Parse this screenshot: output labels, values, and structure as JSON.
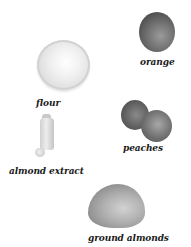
{
  "ingredients": [
    {
      "name": "orange",
      "label": "orange",
      "color": "#6e6e6e"
    },
    {
      "name": "flour",
      "label": "flour",
      "color": "#f1f1f1"
    },
    {
      "name": "peaches",
      "label": "peaches",
      "color": "#6a6a6a"
    },
    {
      "name": "almond-extract",
      "label": "almond extract",
      "color": "#dcdcdc"
    },
    {
      "name": "ground-almonds",
      "label": "ground almonds",
      "color": "#a8a8a8"
    }
  ]
}
